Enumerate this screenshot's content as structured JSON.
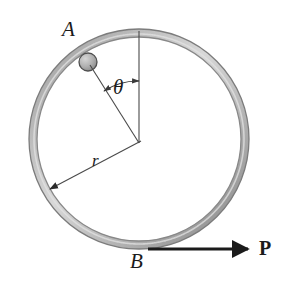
{
  "figure": {
    "kind": "physics-diagram",
    "background_color": "#ffffff",
    "ink_color": "#1b1b1b",
    "ring": {
      "name": "hoop",
      "center_x": 139,
      "center_y": 139,
      "outer_radius": 110,
      "tube_thickness": 8,
      "stroke_color": "#6e6e6e",
      "highlight_color": "#cfcfcf",
      "shadow_color": "#8a8a8a"
    },
    "bead": {
      "name": "bead",
      "center_x": 88,
      "center_y": 62,
      "radius": 9,
      "fill_color": "#b5b5b5",
      "stroke_color": "#4a4a4a"
    },
    "vertical_line": {
      "x": 139,
      "y_top": 31,
      "y_bottom": 143
    },
    "radius_line_to_bead": {
      "x1": 139,
      "y1": 143,
      "x2": 89,
      "y2": 64
    },
    "radius_arrow": {
      "x1": 139,
      "y1": 143,
      "x2": 48,
      "y2": 191
    },
    "angle_arc": {
      "center_x": 139,
      "center_y": 143,
      "radius": 62,
      "start_angle_deg": -90,
      "end_angle_deg": -122,
      "double_headed": true
    },
    "force_arrow": {
      "x1": 148,
      "y1": 249,
      "x2": 252,
      "y2": 249,
      "line_width": 3
    },
    "labels": {
      "point_a": "A",
      "angle": "θ",
      "radius": "r",
      "point_b": "B",
      "force": "P"
    }
  }
}
